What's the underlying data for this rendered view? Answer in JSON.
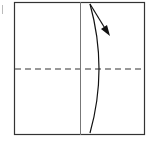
{
  "diagram": {
    "type": "origami-fold-step",
    "paper": {
      "x": 14,
      "y": 2,
      "width": 131,
      "height": 133,
      "stroke": "#333333"
    },
    "creases": [
      {
        "kind": "valley-vertical-existing",
        "x": 80,
        "y1": 2,
        "y2": 135,
        "stroke": "#777777"
      },
      {
        "kind": "valley-fold-line",
        "y": 69,
        "x1": 14,
        "x2": 145,
        "stroke": "#777777",
        "dash": "6,4"
      }
    ],
    "arrow": {
      "label": "fold-direction",
      "stroke": "#111111"
    },
    "colors": {
      "background": "#ffffff",
      "paper_edge": "#333333",
      "crease": "#777777",
      "arrow": "#111111"
    }
  }
}
